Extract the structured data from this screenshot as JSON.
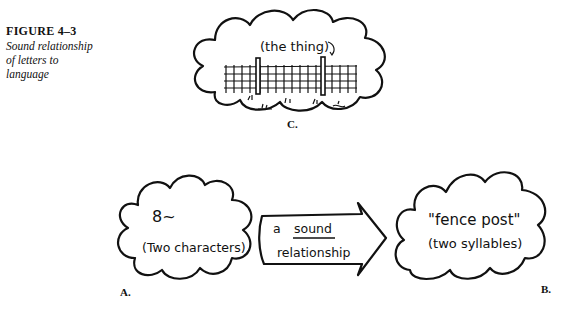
{
  "caption": {
    "figure_number": "FIGURE 4–3",
    "title_line1": "Sound relationship",
    "title_line2": "of letters to",
    "title_line3": "language"
  },
  "panels": {
    "c": {
      "label": "C.",
      "annotation": "(the thing)",
      "picture": "fence-with-posts"
    },
    "a": {
      "label": "A.",
      "symbols": "8~",
      "caption": "(Two characters)"
    },
    "arrow": {
      "line1_prefix": "a",
      "line1_word": "sound",
      "line2": "relationship"
    },
    "b": {
      "label": "B.",
      "word": "\"fence post\"",
      "caption": "(two syllables)"
    }
  }
}
